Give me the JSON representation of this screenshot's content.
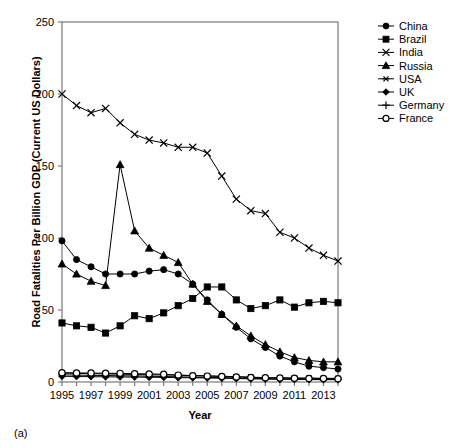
{
  "caption": "(a)",
  "chart_data": {
    "type": "line",
    "title": "",
    "xlabel": "Year",
    "ylabel": "Road Fatalities Per Billion GDP (Current US Dollars)",
    "xlim": [
      1995,
      2014
    ],
    "ylim": [
      0,
      250
    ],
    "yticks": [
      0,
      50,
      100,
      150,
      200,
      250
    ],
    "xticks": [
      1995,
      1997,
      1999,
      2001,
      2003,
      2005,
      2007,
      2009,
      2011,
      2013
    ],
    "x": [
      1995,
      1996,
      1997,
      1998,
      1999,
      2000,
      2001,
      2002,
      2003,
      2004,
      2005,
      2006,
      2007,
      2008,
      2009,
      2010,
      2011,
      2012,
      2013,
      2014
    ],
    "grid": false,
    "legend_position": "top-right",
    "series": [
      {
        "name": "China",
        "marker": "circle-filled",
        "values": [
          98,
          85,
          80,
          75,
          75,
          75,
          77,
          78,
          75,
          68,
          57,
          47,
          38,
          30,
          24,
          18,
          14,
          11,
          10,
          9
        ]
      },
      {
        "name": "Brazil",
        "marker": "square-filled",
        "values": [
          41,
          39,
          38,
          34,
          39,
          46,
          44,
          48,
          53,
          58,
          66,
          66,
          57,
          51,
          53,
          57,
          52,
          55,
          56,
          55
        ]
      },
      {
        "name": "India",
        "marker": "x",
        "values": [
          200,
          192,
          187,
          190,
          180,
          172,
          168,
          166,
          163,
          163,
          159,
          143,
          127,
          119,
          117,
          104,
          100,
          93,
          88,
          84
        ]
      },
      {
        "name": "Russia",
        "marker": "triangle-filled",
        "values": [
          82,
          75,
          70,
          67,
          151,
          105,
          93,
          88,
          83,
          68,
          56,
          47,
          39,
          32,
          26,
          21,
          17,
          15,
          14,
          14
        ]
      },
      {
        "name": "USA",
        "marker": "asterisk",
        "values": [
          6.2,
          6.0,
          5.8,
          5.6,
          5.4,
          5.2,
          5.0,
          4.9,
          4.7,
          4.5,
          4.3,
          4.0,
          3.7,
          3.4,
          3.0,
          2.9,
          2.8,
          2.7,
          2.6,
          2.5
        ]
      },
      {
        "name": "UK",
        "marker": "diamond-filled",
        "values": [
          4.0,
          3.8,
          3.7,
          3.6,
          3.5,
          3.4,
          3.3,
          3.2,
          3.0,
          2.9,
          2.8,
          2.6,
          2.4,
          2.2,
          2.0,
          1.9,
          1.8,
          1.7,
          1.6,
          1.6
        ]
      },
      {
        "name": "Germany",
        "marker": "plus",
        "values": [
          5.0,
          4.8,
          4.6,
          4.5,
          4.3,
          4.2,
          4.0,
          3.8,
          3.6,
          3.4,
          3.2,
          3.0,
          2.8,
          2.6,
          2.3,
          2.2,
          2.1,
          2.0,
          1.9,
          1.8
        ]
      },
      {
        "name": "France",
        "marker": "circle-open",
        "values": [
          6.5,
          6.3,
          6.2,
          6.1,
          6.0,
          5.8,
          5.6,
          5.4,
          4.8,
          4.4,
          4.1,
          3.8,
          3.5,
          3.2,
          2.9,
          2.8,
          2.6,
          2.5,
          2.4,
          2.3
        ]
      }
    ]
  }
}
